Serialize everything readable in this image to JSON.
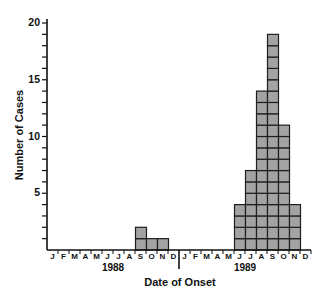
{
  "chart_data": {
    "type": "bar",
    "title": "",
    "xlabel": "Date of Onset",
    "ylabel": "Number of Cases",
    "ylim": [
      0,
      20
    ],
    "yticks_labeled": [
      5,
      10,
      15,
      20
    ],
    "ytick_minor_step": 1,
    "grid": false,
    "legend": null,
    "style": "stacked unit boxes (each box = 1 case)",
    "years": [
      "1988",
      "1989"
    ],
    "month_labels": [
      "J",
      "F",
      "M",
      "A",
      "M",
      "J",
      "J",
      "A",
      "S",
      "O",
      "N",
      "D"
    ],
    "categories": [
      "Jan 1988",
      "Feb 1988",
      "Mar 1988",
      "Apr 1988",
      "May 1988",
      "Jun 1988",
      "Jul 1988",
      "Aug 1988",
      "Sep 1988",
      "Oct 1988",
      "Nov 1988",
      "Dec 1988",
      "Jan 1989",
      "Feb 1989",
      "Mar 1989",
      "Apr 1989",
      "May 1989",
      "Jun 1989",
      "Jul 1989",
      "Aug 1989",
      "Sep 1989",
      "Oct 1989",
      "Nov 1989",
      "Dec 1989"
    ],
    "values": [
      0,
      0,
      0,
      0,
      0,
      0,
      0,
      0,
      2,
      1,
      1,
      0,
      0,
      0,
      0,
      0,
      0,
      4,
      7,
      14,
      19,
      11,
      4,
      0
    ]
  },
  "colors": {
    "box_fill": "#a3a3a3",
    "box_stroke": "#1e1e1e",
    "axis": "#111111"
  }
}
